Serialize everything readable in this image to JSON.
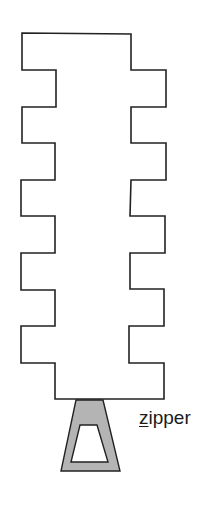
{
  "diagram": {
    "shape": "zipper-track",
    "teeth_per_side": 5,
    "colors": {
      "outline": "#222222",
      "slider_fill": "#b4b4b4",
      "background": "#ffffff"
    },
    "label": {
      "underlined_letter": "z",
      "rest": "ipper",
      "full_text": "zipper"
    }
  }
}
